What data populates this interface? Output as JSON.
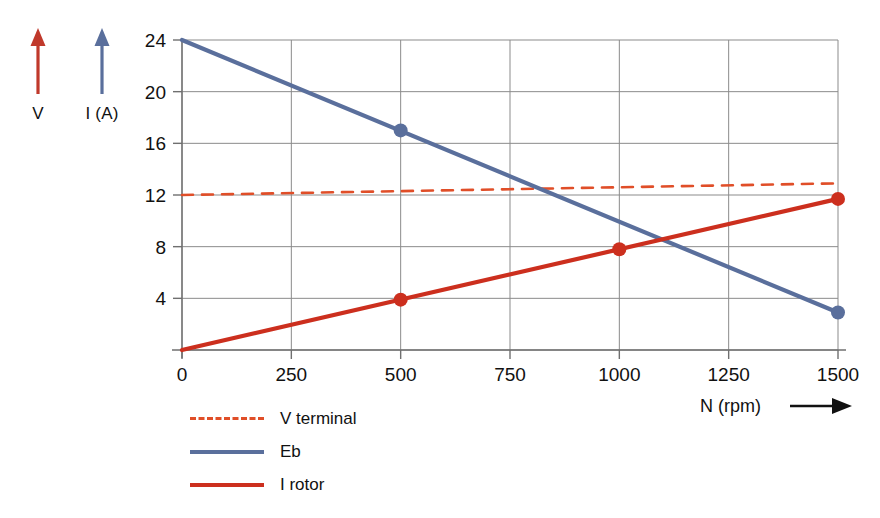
{
  "axis_indicators": [
    {
      "name": "voltage",
      "label": "V",
      "color": "#c0392b",
      "arrow": "up-arrow-icon"
    },
    {
      "name": "current",
      "label": "I (A)",
      "color": "#5a6f9c",
      "arrow": "up-arrow-icon"
    }
  ],
  "xaxis_title": "N (rpm)",
  "xaxis_arrow": "right-arrow-icon",
  "legend": [
    {
      "label": "V terminal",
      "color": "#e04e28",
      "style": "dashed"
    },
    {
      "label": "Eb",
      "color": "#5a6f9c",
      "style": "solid"
    },
    {
      "label": "I rotor",
      "color": "#cc2f1e",
      "style": "solid"
    }
  ],
  "chart_data": {
    "type": "line",
    "title": "",
    "xlabel": "N (rpm)",
    "ylabel": "V  /  I (A)",
    "xlim": [
      0,
      1500
    ],
    "ylim": [
      0,
      24
    ],
    "xticks": [
      0,
      250,
      500,
      750,
      1000,
      1250,
      1500
    ],
    "yticks": [
      4,
      8,
      12,
      16,
      20,
      24
    ],
    "grid": true,
    "legend_position": "below-left",
    "series": [
      {
        "name": "V terminal",
        "color": "#e04e28",
        "style": "dashed",
        "x": [
          0,
          1500
        ],
        "y": [
          12.0,
          12.9
        ],
        "markers": []
      },
      {
        "name": "Eb",
        "color": "#5a6f9c",
        "style": "solid",
        "x": [
          0,
          1500
        ],
        "y": [
          24.0,
          2.9
        ],
        "markers": [
          {
            "x": 500,
            "y": 17.0
          },
          {
            "x": 1500,
            "y": 2.9
          }
        ]
      },
      {
        "name": "I rotor",
        "color": "#cc2f1e",
        "style": "solid",
        "x": [
          0,
          1500
        ],
        "y": [
          0.0,
          11.7
        ],
        "markers": [
          {
            "x": 500,
            "y": 3.9
          },
          {
            "x": 1000,
            "y": 7.8
          },
          {
            "x": 1500,
            "y": 11.7
          }
        ]
      }
    ]
  }
}
